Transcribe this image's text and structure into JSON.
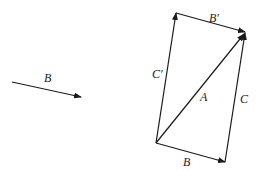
{
  "diagram": {
    "colors": {
      "stroke": "#1a1a1a",
      "background": "#ffffff"
    },
    "standalone_vector": {
      "label": "B"
    },
    "parallelogram": {
      "bottom_edge": {
        "label": "B"
      },
      "top_edge": {
        "label": "B′"
      },
      "left_edge": {
        "label": "C′"
      },
      "right_edge": {
        "label": "C"
      },
      "diagonal": {
        "label": "A"
      }
    }
  }
}
